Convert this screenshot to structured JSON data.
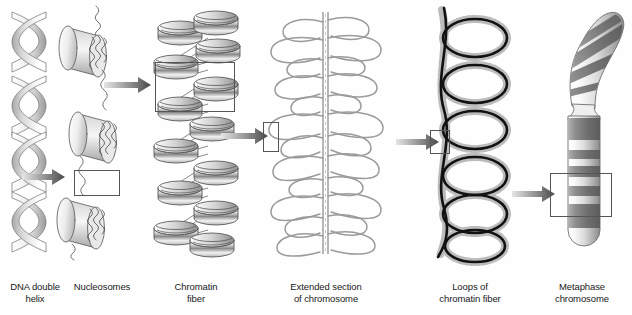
{
  "figure": {
    "background_color": "#fefefe",
    "ink_color": "#333333",
    "arrow_color_dark": "#4a4a4a",
    "arrow_color_light": "#e8e8e8",
    "highlight_box_color": "#555555"
  },
  "panels": [
    {
      "id": "dna-double-helix",
      "caption_line1": "DNA double",
      "caption_line2": "helix",
      "structure": "double-helix-ribbon",
      "turns": 7
    },
    {
      "id": "nucleosomes",
      "caption_line1": "Nucleosomes",
      "caption_line2": "",
      "structure": "histone-cylinders-with-linker-dna",
      "bead_count": 3
    },
    {
      "id": "chromatin-fiber",
      "caption_line1": "Chromatin",
      "caption_line2": "fiber",
      "structure": "zigzag-solenoid-30nm",
      "disc_count": 22
    },
    {
      "id": "extended-chromosome",
      "caption_line1": "Extended section",
      "caption_line2": "of chromosome",
      "structure": "scaffold-with-looped-domains",
      "loop_count": 26
    },
    {
      "id": "loops-of-chromatin-fiber",
      "caption_line1": "Loops of",
      "caption_line2": "chromatin fiber",
      "structure": "coiled-scaffold-with-bristled-loops",
      "loop_count": 6
    },
    {
      "id": "metaphase-chromosome",
      "caption_line1": "Metaphase",
      "caption_line2": "chromosome",
      "structure": "banded-condensed-chromatid",
      "band_count": 9
    }
  ],
  "arrows": [
    {
      "id": "arrow-helix-to-nucleosomes",
      "from": "dna-double-helix",
      "to": "nucleosomes"
    },
    {
      "id": "arrow-nucleosomes-to-chromatin",
      "from": "nucleosomes",
      "to": "chromatin-fiber"
    },
    {
      "id": "arrow-chromatin-to-extended",
      "from": "chromatin-fiber",
      "to": "extended-chromosome"
    },
    {
      "id": "arrow-extended-to-loops",
      "from": "extended-chromosome",
      "to": "loops-of-chromatin-fiber"
    },
    {
      "id": "arrow-loops-to-metaphase",
      "from": "loops-of-chromatin-fiber",
      "to": "metaphase-chromosome"
    }
  ],
  "highlight_boxes": [
    {
      "id": "highlight-nucleosome-linker",
      "panel": "nucleosomes"
    },
    {
      "id": "highlight-chromatin-segment",
      "panel": "chromatin-fiber"
    },
    {
      "id": "highlight-extended-loop",
      "panel": "extended-chromosome"
    },
    {
      "id": "highlight-loop-scaffold",
      "panel": "loops-of-chromatin-fiber"
    },
    {
      "id": "highlight-metaphase-band",
      "panel": "metaphase-chromosome"
    }
  ]
}
